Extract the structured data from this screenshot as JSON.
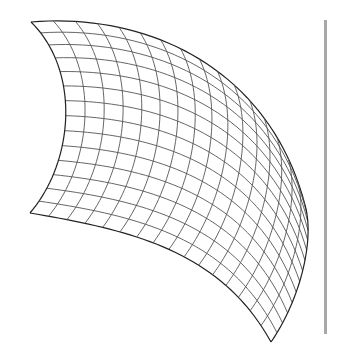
{
  "figure": {
    "type": "wireframe-surface-patch",
    "rows": 14,
    "cols": 16,
    "stroke_color": "#555555",
    "edge_color": "#222222",
    "divider_color": "#a8a8a8",
    "corners": {
      "top_left": [
        31,
        22
      ],
      "top_right": [
        305,
        205
      ],
      "bottom_right": [
        271,
        342
      ],
      "bottom_left": [
        30,
        213
      ]
    },
    "edge_controls": {
      "top": [
        [
          150,
          12
        ],
        [
          270,
          70
        ]
      ],
      "right": [
        [
          315,
          240
        ],
        [
          300,
          300
        ]
      ],
      "bottom": [
        [
          130,
          230
        ],
        [
          220,
          250
        ]
      ],
      "left": [
        [
          80,
          70
        ],
        [
          75,
          160
        ]
      ]
    }
  }
}
